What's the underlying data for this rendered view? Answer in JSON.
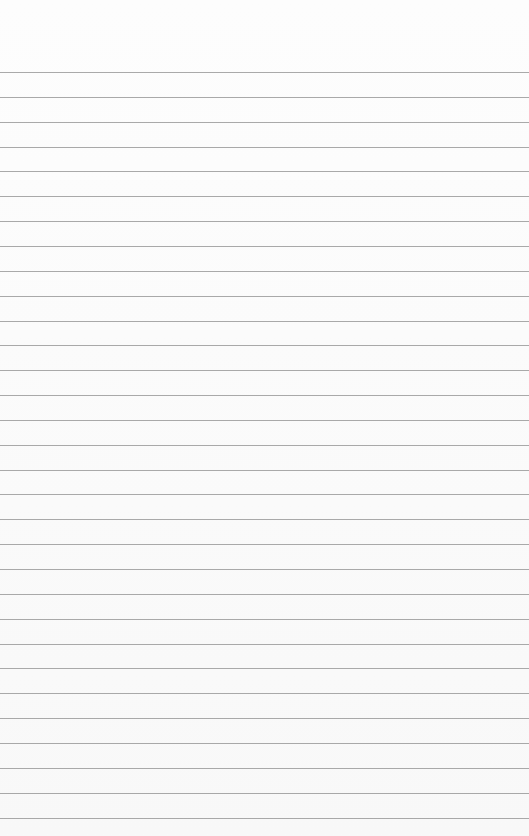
{
  "page": {
    "type": "lined-paper",
    "line_count": 31,
    "first_line_y": 72,
    "line_spacing": 24.85,
    "line_color": "#8e8e8e",
    "background": "#fbfbfb"
  }
}
